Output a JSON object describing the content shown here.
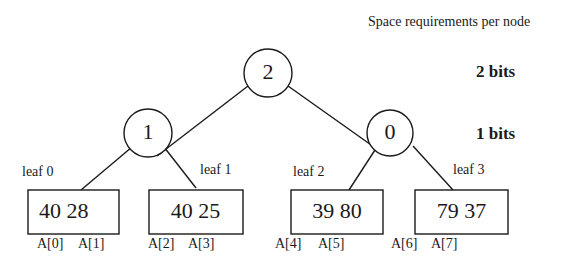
{
  "header": {
    "title": "Space requirements per node"
  },
  "levels": [
    {
      "label": "2 bits"
    },
    {
      "label": "1 bits"
    }
  ],
  "tree": {
    "root": {
      "value": "2"
    },
    "internal": [
      {
        "value": "1"
      },
      {
        "value": "0"
      }
    ],
    "leaves": [
      {
        "label": "leaf 0",
        "values": "40  28",
        "indices": [
          "A[0]",
          "A[1]"
        ]
      },
      {
        "label": "leaf 1",
        "values": "40  25",
        "indices": [
          "A[2]",
          "A[3]"
        ]
      },
      {
        "label": "leaf 2",
        "values": "39  80",
        "indices": [
          "A[4]",
          "A[5]"
        ]
      },
      {
        "label": "leaf 3",
        "values": "79  37",
        "indices": [
          "A[6]",
          "A[7]"
        ]
      }
    ]
  },
  "colors": {
    "stroke": "#1a1a1a",
    "background": "#ffffff"
  }
}
